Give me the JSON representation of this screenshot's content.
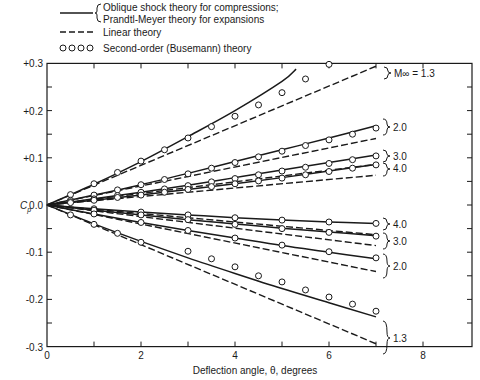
{
  "chart_data": {
    "type": "line",
    "title": "",
    "xlabel": "Deflection angle, θ, degrees",
    "ylabel": "Cp",
    "xlim": [
      0,
      9
    ],
    "ylim": [
      -0.3,
      0.3
    ],
    "x_ticks": [
      0,
      2,
      4,
      6,
      8
    ],
    "y_ticks": [
      "+0.3",
      "+0.2",
      "+0.1",
      "0.0",
      "-0.1",
      "-0.2",
      "-0.3"
    ],
    "grid": false,
    "legend_position": "top-left, above plot",
    "legend": [
      {
        "style": "solid",
        "label_line1": "Oblique shock theory  for compressions;",
        "label_line2": "Prandtl-Meyer theory for expansions"
      },
      {
        "style": "dashed",
        "label": "Linear theory"
      },
      {
        "style": "circles",
        "label": "Second-order (Busemann) theory"
      }
    ],
    "mach_labels": {
      "m13_top": "M∞ = 1.3",
      "m20": "2.0",
      "m30": "3.0",
      "m40": "4.0",
      "m13": "1.3"
    },
    "x": [
      0,
      0.5,
      1.0,
      1.5,
      2.0,
      2.5,
      3.0,
      3.5,
      4.0,
      4.5,
      5.0,
      5.5,
      6.0,
      6.5,
      7.0
    ],
    "series": [
      {
        "name": "Linear M=1.3 compression",
        "style": "dashed",
        "x": [
          0,
          7.0
        ],
        "values": [
          0,
          0.294
        ]
      },
      {
        "name": "Linear M=2.0 compression",
        "style": "dashed",
        "x": [
          0,
          7.0
        ],
        "values": [
          0,
          0.141
        ]
      },
      {
        "name": "Linear M=3.0 compression",
        "style": "dashed",
        "x": [
          0,
          7.0
        ],
        "values": [
          0,
          0.086
        ]
      },
      {
        "name": "Linear M=4.0 compression",
        "style": "dashed",
        "x": [
          0,
          7.0
        ],
        "values": [
          0,
          0.063
        ]
      },
      {
        "name": "Linear M=4.0 expansion",
        "style": "dashed",
        "x": [
          0,
          7.0
        ],
        "values": [
          0,
          -0.063
        ]
      },
      {
        "name": "Linear M=3.0 expansion",
        "style": "dashed",
        "x": [
          0,
          7.0
        ],
        "values": [
          0,
          -0.086
        ]
      },
      {
        "name": "Linear M=2.0 expansion",
        "style": "dashed",
        "x": [
          0,
          7.0
        ],
        "values": [
          0,
          -0.141
        ]
      },
      {
        "name": "Linear M=1.3 expansion",
        "style": "dashed",
        "x": [
          0,
          7.0
        ],
        "values": [
          0,
          -0.294
        ]
      },
      {
        "name": "Oblique shock M=1.3",
        "style": "solid",
        "x": [
          0,
          1,
          2,
          3,
          4,
          5,
          5.3
        ],
        "values": [
          0,
          0.044,
          0.092,
          0.145,
          0.2,
          0.262,
          0.288
        ]
      },
      {
        "name": "Oblique shock M=2.0",
        "style": "solid",
        "x": [
          0,
          1,
          2,
          3,
          4,
          5,
          6,
          7
        ],
        "values": [
          0,
          0.021,
          0.043,
          0.067,
          0.092,
          0.117,
          0.142,
          0.168
        ]
      },
      {
        "name": "Oblique shock M=3.0",
        "style": "solid",
        "x": [
          0,
          1,
          2,
          3,
          4,
          5,
          6,
          7
        ],
        "values": [
          0,
          0.013,
          0.027,
          0.042,
          0.058,
          0.074,
          0.09,
          0.106
        ]
      },
      {
        "name": "Oblique shock M=4.0",
        "style": "solid",
        "x": [
          0,
          1,
          2,
          3,
          4,
          5,
          6,
          7
        ],
        "values": [
          0,
          0.01,
          0.021,
          0.033,
          0.045,
          0.058,
          0.072,
          0.086
        ]
      },
      {
        "name": "Prandtl-Meyer M=4.0",
        "style": "solid",
        "x": [
          0,
          1,
          2,
          3,
          4,
          5,
          6,
          7
        ],
        "values": [
          0,
          -0.008,
          -0.015,
          -0.021,
          -0.027,
          -0.032,
          -0.036,
          -0.039
        ]
      },
      {
        "name": "Prandtl-Meyer M=3.0",
        "style": "solid",
        "x": [
          0,
          1,
          2,
          3,
          4,
          5,
          6,
          7
        ],
        "values": [
          0,
          -0.011,
          -0.021,
          -0.031,
          -0.04,
          -0.049,
          -0.057,
          -0.065
        ]
      },
      {
        "name": "Prandtl-Meyer M=2.0",
        "style": "solid",
        "x": [
          0,
          1,
          2,
          3,
          4,
          5,
          6,
          7
        ],
        "values": [
          0,
          -0.019,
          -0.037,
          -0.054,
          -0.07,
          -0.086,
          -0.1,
          -0.114
        ]
      },
      {
        "name": "Prandtl-Meyer M=1.3",
        "style": "solid",
        "x": [
          0,
          1,
          2,
          3,
          4,
          5,
          6,
          7
        ],
        "values": [
          0,
          -0.04,
          -0.077,
          -0.112,
          -0.145,
          -0.177,
          -0.207,
          -0.237
        ]
      },
      {
        "name": "Busemann M=1.3 compression",
        "style": "circles",
        "x": [
          0.5,
          1.0,
          1.5,
          2.0,
          2.5,
          3.0,
          3.5,
          4.0,
          4.5,
          5.0,
          5.5,
          6.0
        ],
        "values": [
          0.022,
          0.045,
          0.069,
          0.093,
          0.117,
          0.142,
          0.166,
          0.188,
          0.212,
          0.238,
          0.267,
          0.298
        ]
      },
      {
        "name": "Busemann M=2.0 compression",
        "style": "circles",
        "x": [
          0.5,
          1.0,
          1.5,
          2.0,
          2.5,
          3.0,
          3.5,
          4.0,
          4.5,
          5.0,
          5.5,
          6.0,
          6.5,
          7.0
        ],
        "values": [
          0.01,
          0.021,
          0.032,
          0.043,
          0.054,
          0.066,
          0.078,
          0.09,
          0.102,
          0.114,
          0.126,
          0.138,
          0.15,
          0.163
        ]
      },
      {
        "name": "Busemann M=3.0 compression",
        "style": "circles",
        "x": [
          0.5,
          1.0,
          1.5,
          2.0,
          2.5,
          3.0,
          3.5,
          4.0,
          4.5,
          5.0,
          5.5,
          6.0,
          6.5,
          7.0
        ],
        "values": [
          0.007,
          0.013,
          0.02,
          0.027,
          0.034,
          0.041,
          0.049,
          0.056,
          0.064,
          0.072,
          0.08,
          0.088,
          0.096,
          0.104
        ]
      },
      {
        "name": "Busemann M=4.0 compression",
        "style": "circles",
        "x": [
          0.5,
          1.0,
          1.5,
          2.0,
          2.5,
          3.0,
          3.5,
          4.0,
          4.5,
          5.0,
          5.5,
          6.0,
          6.5,
          7.0
        ],
        "values": [
          0.005,
          0.01,
          0.016,
          0.021,
          0.027,
          0.033,
          0.039,
          0.045,
          0.051,
          0.057,
          0.064,
          0.071,
          0.078,
          0.085
        ]
      },
      {
        "name": "Busemann M=4.0 expansion",
        "style": "circles",
        "x": [
          1.0,
          2.0,
          3.0,
          4.0,
          5.0,
          6.0,
          7.0
        ],
        "values": [
          -0.008,
          -0.015,
          -0.021,
          -0.027,
          -0.032,
          -0.036,
          -0.039
        ]
      },
      {
        "name": "Busemann M=3.0 expansion",
        "style": "circles",
        "x": [
          1.0,
          2.0,
          3.0,
          4.0,
          5.0,
          6.0,
          7.0
        ],
        "values": [
          -0.011,
          -0.021,
          -0.031,
          -0.041,
          -0.05,
          -0.058,
          -0.066
        ]
      },
      {
        "name": "Busemann M=2.0 expansion",
        "style": "circles",
        "x": [
          1.0,
          2.0,
          3.0,
          4.0,
          5.0,
          6.0,
          7.0
        ],
        "values": [
          -0.019,
          -0.037,
          -0.054,
          -0.07,
          -0.085,
          -0.099,
          -0.112
        ]
      },
      {
        "name": "Busemann M=1.3 expansion",
        "style": "circles",
        "x": [
          0.5,
          1.0,
          1.5,
          2.0,
          3.0,
          3.5,
          4.0,
          4.5,
          5.0,
          5.5,
          6.0,
          6.5,
          7.0
        ],
        "values": [
          -0.021,
          -0.041,
          -0.06,
          -0.079,
          -0.098,
          -0.114,
          -0.131,
          -0.15,
          -0.163,
          -0.18,
          -0.195,
          -0.21,
          -0.225
        ]
      }
    ]
  }
}
